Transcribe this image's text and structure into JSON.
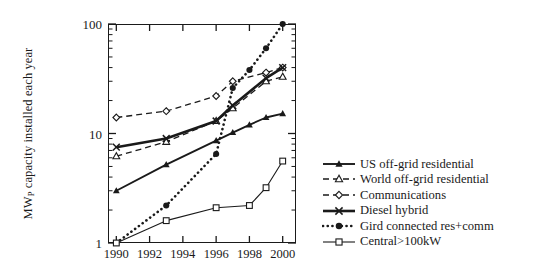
{
  "chart_data": {
    "type": "line",
    "title": "",
    "xlabel": "",
    "ylabel": "MWp capacity installed each year",
    "ylabel_prefix": "MW",
    "ylabel_sub": "P",
    "ylabel_suffix": " capacity installed each year",
    "yscale": "log",
    "ylim": [
      1,
      100
    ],
    "ytick_labels": [
      "100",
      "10",
      "1"
    ],
    "ytick_values": [
      100,
      10,
      1
    ],
    "xlim": [
      1989.5,
      2000.8
    ],
    "xtick_labels": [
      "1990",
      "1992",
      "1994",
      "1996",
      "1998",
      "2000"
    ],
    "xtick_values": [
      1990,
      1992,
      1994,
      1996,
      1998,
      2000
    ],
    "grid": false,
    "legend_position": "right",
    "series": [
      {
        "name": "US off-grid residential",
        "marker": "filled-triangle",
        "linestyle": "solid",
        "x": [
          1990,
          1993,
          1996,
          1997,
          1998,
          1999,
          2000
        ],
        "values": [
          3.0,
          5.2,
          8.6,
          10.2,
          12.0,
          14.0,
          15.2
        ]
      },
      {
        "name": "World off-grid residential",
        "marker": "open-triangle",
        "linestyle": "dashed",
        "x": [
          1990,
          1993,
          1996,
          1997,
          1999,
          2000
        ],
        "values": [
          6.2,
          8.4,
          13.0,
          17.0,
          30.0,
          33.0
        ]
      },
      {
        "name": "Communications",
        "marker": "open-diamond",
        "linestyle": "dashed",
        "x": [
          1990,
          1993,
          1996,
          1997,
          1999,
          2000
        ],
        "values": [
          14.0,
          16.0,
          22.0,
          30.0,
          36.0,
          40.0
        ]
      },
      {
        "name": "Diesel hybrid",
        "marker": "cross-x",
        "linestyle": "solid-thick",
        "x": [
          1990,
          1993,
          1996,
          1997,
          1999,
          2000
        ],
        "values": [
          7.5,
          9.0,
          13.0,
          18.0,
          32.0,
          40.0
        ]
      },
      {
        "name": "Gird connected res+comm",
        "marker": "filled-circle",
        "linestyle": "dotted",
        "x": [
          1990,
          1993,
          1996,
          1997,
          1998,
          1999,
          2000
        ],
        "values": [
          1.0,
          2.2,
          6.5,
          26.0,
          38.0,
          60.0,
          100.0
        ]
      },
      {
        "name": "Central>100kW",
        "marker": "open-square",
        "linestyle": "solid-thin",
        "x": [
          1990,
          1993,
          1996,
          1998,
          1999,
          2000
        ],
        "values": [
          1.0,
          1.6,
          2.1,
          2.2,
          3.2,
          5.6
        ]
      }
    ]
  },
  "legend": {
    "items": [
      {
        "label": "US off-grid residential"
      },
      {
        "label": "World off-grid residential"
      },
      {
        "label": "Communications"
      },
      {
        "label": "Diesel hybrid"
      },
      {
        "label": "Gird connected res+comm"
      },
      {
        "label": "Central>100kW"
      }
    ]
  }
}
